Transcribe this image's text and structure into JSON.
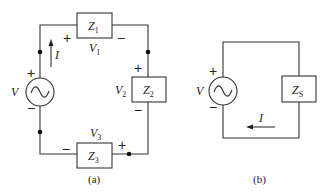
{
  "figure": {
    "panel_a": {
      "caption": "(a)",
      "source": {
        "label": "V",
        "plus": "+",
        "minus": "−"
      },
      "current": {
        "label": "I"
      },
      "impedances": [
        {
          "name": "Z",
          "sub": "1",
          "voltage": "V",
          "voltage_sub": "1",
          "plus": "+",
          "minus": "−"
        },
        {
          "name": "Z",
          "sub": "2",
          "voltage": "V",
          "voltage_sub": "2",
          "plus": "+",
          "minus": "−"
        },
        {
          "name": "Z",
          "sub": "3",
          "voltage": "V",
          "voltage_sub": "3",
          "plus": "+",
          "minus": "−"
        }
      ]
    },
    "panel_b": {
      "caption": "(b)",
      "source": {
        "label": "V",
        "plus": "+",
        "minus": "−"
      },
      "current": {
        "label": "I"
      },
      "impedance": {
        "name": "Z",
        "sub": "S"
      }
    },
    "colors": {
      "line": "#333333",
      "background": "#ffffff"
    }
  }
}
